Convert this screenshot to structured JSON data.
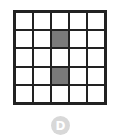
{
  "grid": {
    "rows": 5,
    "cols": 5,
    "shaded_color": "#7a7a7a",
    "shaded_cells": [
      [
        1,
        2
      ],
      [
        3,
        2
      ]
    ]
  },
  "badge": {
    "label": "D",
    "color": "#d8d8d8"
  }
}
